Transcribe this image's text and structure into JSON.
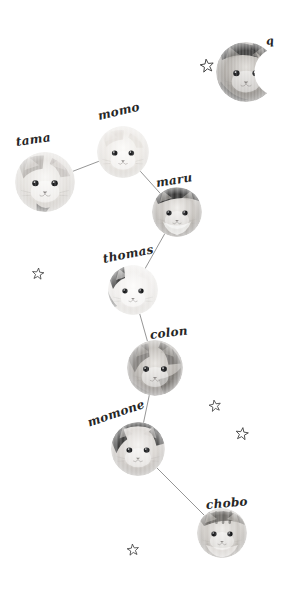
{
  "canvas": {
    "width": 283,
    "height": 597,
    "background": "#ffffff"
  },
  "theme": {
    "line_color": "#8a8a8a",
    "label_color": "#262626",
    "star_stroke": "#3d3d3d",
    "fur_light": "#e9e7e4",
    "fur_mid": "#b9b5b0",
    "fur_dark": "#6d6a66",
    "fur_black": "#2b2b2b"
  },
  "cats": [
    {
      "id": "q",
      "label": "q",
      "cx": 246,
      "cy": 72,
      "r": 30,
      "mask": "crescent",
      "label_x": 266,
      "label_y": 36,
      "label_rot": -8,
      "label_size": 11,
      "coat": "tabby-dark"
    },
    {
      "id": "momo",
      "label": "momo",
      "cx": 123,
      "cy": 152,
      "r": 26,
      "mask": "circle",
      "label_x": 98,
      "label_y": 110,
      "label_rot": -13,
      "label_size": 12,
      "coat": "white-cream"
    },
    {
      "id": "tama",
      "label": "tama",
      "cx": 45,
      "cy": 182,
      "r": 30,
      "mask": "circle",
      "label_x": 16,
      "label_y": 136,
      "label_rot": -8,
      "label_size": 12,
      "coat": "white-grey"
    },
    {
      "id": "maru",
      "label": "maru",
      "cx": 177,
      "cy": 212,
      "r": 25,
      "mask": "circle",
      "label_x": 156,
      "label_y": 177,
      "label_rot": -9,
      "label_size": 12,
      "coat": "tabby-cap"
    },
    {
      "id": "thomas",
      "label": "thomas",
      "cx": 133,
      "cy": 290,
      "r": 25,
      "mask": "circle",
      "label_x": 103,
      "label_y": 253,
      "label_rot": -11,
      "label_size": 12,
      "coat": "white-patch"
    },
    {
      "id": "colon",
      "label": "colon",
      "cx": 155,
      "cy": 368,
      "r": 28,
      "mask": "circle",
      "label_x": 150,
      "label_y": 329,
      "label_rot": -7,
      "label_size": 12,
      "coat": "grey-patch"
    },
    {
      "id": "momone",
      "label": "momone",
      "cx": 138,
      "cy": 449,
      "r": 27,
      "mask": "circle",
      "label_x": 88,
      "label_y": 417,
      "label_rot": -19,
      "label_size": 12,
      "coat": "black-cap"
    },
    {
      "id": "chobo",
      "label": "chobo",
      "cx": 222,
      "cy": 533,
      "r": 25,
      "mask": "circle",
      "label_x": 206,
      "label_y": 499,
      "label_rot": -5,
      "label_size": 12,
      "coat": "tabby-stripe"
    }
  ],
  "edges": [
    {
      "from": "tama",
      "to": "momo"
    },
    {
      "from": "momo",
      "to": "maru"
    },
    {
      "from": "maru",
      "to": "thomas"
    },
    {
      "from": "thomas",
      "to": "colon"
    },
    {
      "from": "colon",
      "to": "momone"
    },
    {
      "from": "momone",
      "to": "chobo"
    }
  ],
  "stars": [
    {
      "x": 207,
      "y": 66,
      "size": 15,
      "rot": -8
    },
    {
      "x": 38,
      "y": 274,
      "size": 13,
      "rot": 6
    },
    {
      "x": 215,
      "y": 406,
      "size": 13,
      "rot": -10
    },
    {
      "x": 242,
      "y": 434,
      "size": 14,
      "rot": 8
    },
    {
      "x": 133,
      "y": 550,
      "size": 13,
      "rot": -6
    }
  ]
}
